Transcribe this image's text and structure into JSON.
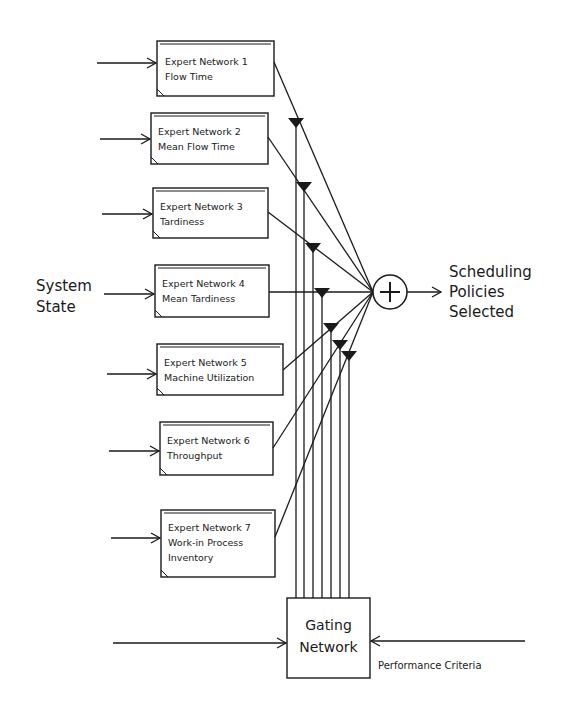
{
  "diagram": {
    "input_label": [
      "System",
      "State"
    ],
    "output_label": [
      "Scheduling",
      "Policies",
      "Selected"
    ],
    "sum_node": {
      "symbol": "+",
      "name": "summation-node"
    },
    "gating": {
      "label": [
        "Gating",
        "Network"
      ],
      "criteria_label": "Performance Criteria"
    },
    "experts": [
      {
        "title": "Expert Network 1",
        "lines": [
          "Flow Time"
        ]
      },
      {
        "title": "Expert Network 2",
        "lines": [
          "Mean Flow Time"
        ]
      },
      {
        "title": "Expert Network 3",
        "lines": [
          "Tardiness"
        ]
      },
      {
        "title": "Expert Network 4",
        "lines": [
          "Mean Tardiness"
        ]
      },
      {
        "title": "Expert Network 5",
        "lines": [
          "Machine Utilization"
        ]
      },
      {
        "title": "Expert Network 6",
        "lines": [
          "Throughput"
        ]
      },
      {
        "title": "Expert Network 7",
        "lines": [
          "Work-in Process",
          "Inventory"
        ]
      }
    ]
  }
}
